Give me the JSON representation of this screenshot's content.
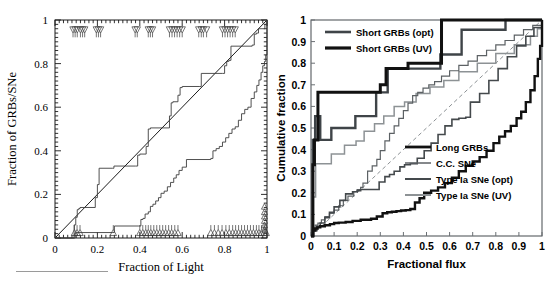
{
  "figure": {
    "title": "",
    "panels": [
      "left",
      "right"
    ]
  },
  "chart_data": [
    {
      "id": "left-panel",
      "type": "line",
      "title": "",
      "xlabel": "Fraction of Light",
      "ylabel": "Fraction of GRBs/SNe",
      "xlim": [
        0,
        1
      ],
      "ylim": [
        0,
        1
      ],
      "xticks": [
        0,
        0.2,
        0.4,
        0.6,
        0.8,
        1
      ],
      "yticks": [
        0,
        0.2,
        0.4,
        0.6,
        0.8,
        1
      ],
      "xticklabels": [
        "0",
        "0.2",
        "0.4",
        "0.6",
        "0.8",
        "1"
      ],
      "yticklabels": [
        "0",
        "0.2",
        "0.4",
        "0.6",
        "0.8",
        "1"
      ],
      "grid": false,
      "legend": "none",
      "series": [
        {
          "name": "diagonal-reference",
          "style": "solid-thin",
          "color": "#1a1a1a",
          "x": [
            0,
            1
          ],
          "y": [
            0,
            1
          ]
        },
        {
          "name": "upper-step-curve",
          "style": "step-thin",
          "color": "#3d3d3d",
          "x": [
            0.0,
            0.085,
            0.09,
            0.098,
            0.105,
            0.112,
            0.118,
            0.19,
            0.2,
            0.208,
            0.27,
            0.278,
            0.38,
            0.39,
            0.4,
            0.43,
            0.44,
            0.45,
            0.54,
            0.548,
            0.556,
            0.58,
            0.59,
            0.6,
            0.68,
            0.69,
            0.79,
            0.8,
            0.81,
            0.82,
            0.83,
            0.93,
            0.94,
            0.95,
            0.96,
            0.99,
            1.0
          ],
          "y": [
            0.0,
            0.0,
            0.06,
            0.095,
            0.13,
            0.135,
            0.14,
            0.185,
            0.245,
            0.32,
            0.32,
            0.33,
            0.33,
            0.38,
            0.385,
            0.42,
            0.5,
            0.505,
            0.56,
            0.62,
            0.625,
            0.655,
            0.69,
            0.695,
            0.695,
            0.755,
            0.755,
            0.79,
            0.81,
            0.815,
            0.88,
            0.885,
            0.935,
            0.94,
            0.96,
            0.98,
            1.0
          ]
        },
        {
          "name": "lower-step-curve",
          "style": "step-thin",
          "color": "#3d3d3d",
          "x": [
            0.0,
            0.088,
            0.095,
            0.1,
            0.27,
            0.28,
            0.395,
            0.405,
            0.415,
            0.425,
            0.44,
            0.45,
            0.462,
            0.475,
            0.488,
            0.5,
            0.515,
            0.53,
            0.545,
            0.56,
            0.572,
            0.585,
            0.6,
            0.62,
            0.735,
            0.745,
            0.76,
            0.775,
            0.79,
            0.805,
            0.82,
            0.835,
            0.85,
            0.865,
            0.88,
            0.895,
            0.91,
            0.925,
            0.94,
            0.952,
            0.962,
            0.972,
            0.98,
            0.988,
            0.994,
            1.0
          ],
          "y": [
            0.0,
            0.0,
            0.022,
            0.025,
            0.025,
            0.055,
            0.055,
            0.085,
            0.09,
            0.11,
            0.12,
            0.145,
            0.155,
            0.17,
            0.185,
            0.205,
            0.215,
            0.235,
            0.255,
            0.275,
            0.29,
            0.31,
            0.325,
            0.36,
            0.365,
            0.4,
            0.41,
            0.42,
            0.44,
            0.46,
            0.48,
            0.5,
            0.51,
            0.54,
            0.57,
            0.59,
            0.6,
            0.64,
            0.67,
            0.7,
            0.725,
            0.76,
            0.79,
            0.81,
            0.84,
            1.0
          ]
        }
      ],
      "markers": {
        "top_down_triangles_x": [
          0.085,
          0.095,
          0.105,
          0.12,
          0.13,
          0.14,
          0.195,
          0.205,
          0.215,
          0.378,
          0.388,
          0.44,
          0.45,
          0.46,
          0.54,
          0.552,
          0.564,
          0.576,
          0.588,
          0.6,
          0.678,
          0.69,
          0.7,
          0.715,
          0.79,
          0.802,
          0.814,
          0.826,
          0.838,
          0.85
        ],
        "top_down_triangles_y": 0.955,
        "bottom_up_triangles_x": [
          0.092,
          0.104,
          0.118,
          0.275,
          0.4,
          0.414,
          0.428,
          0.44,
          0.452,
          0.466,
          0.48,
          0.494,
          0.508,
          0.522,
          0.536,
          0.55,
          0.565,
          0.58,
          0.735,
          0.752,
          0.77,
          0.788,
          0.806,
          0.822,
          0.838,
          0.852,
          0.866,
          0.88,
          0.894,
          0.908,
          0.922,
          0.936,
          0.95,
          0.962,
          0.974,
          0.986,
          0.996
        ],
        "bottom_up_triangles_y": 0.025,
        "right_edge_triangles_x": 0.988,
        "right_edge_triangles_y": [
          0.04,
          0.06,
          0.08,
          0.1,
          0.12,
          0.145
        ]
      }
    },
    {
      "id": "right-panel",
      "type": "line",
      "title": "",
      "xlabel": "Fractional flux",
      "ylabel": "Cumulative fraction",
      "xlim": [
        0,
        1
      ],
      "ylim": [
        0,
        1
      ],
      "xticks": [
        0,
        0.1,
        0.2,
        0.3,
        0.4,
        0.5,
        0.6,
        0.7,
        0.8,
        0.9,
        1
      ],
      "yticks": [
        0,
        0.1,
        0.2,
        0.3,
        0.4,
        0.5,
        0.6,
        0.7,
        0.8,
        0.9,
        1
      ],
      "xticklabels": [
        "0",
        "0.1",
        "0.2",
        "0.3",
        "0.4",
        "0.5",
        "0.6",
        "0.7",
        "0.8",
        "0.9",
        "1"
      ],
      "yticklabels": [
        "0",
        "0.1",
        "0.2",
        "0.3",
        "0.4",
        "0.5",
        "0.6",
        "0.7",
        "0.8",
        "0.9",
        "1"
      ],
      "grid": false,
      "legend": "two-blocks: upper-left and lower-right",
      "legend_upper": [
        {
          "label": "Short GRBs (opt)",
          "color": "#3f4448",
          "width": 2.6
        },
        {
          "label": "Short GRBs (UV)",
          "color": "#111111",
          "width": 3.2
        }
      ],
      "legend_lower": [
        {
          "label": "Long GRBs",
          "color": "#111111",
          "width": 2.8
        },
        {
          "label": "C.C. SNe",
          "color": "#5c6164",
          "width": 1.5
        },
        {
          "label": "Type Ia SNe (opt)",
          "color": "#44494c",
          "width": 2.0
        },
        {
          "label": "Type Ia SNe (UV)",
          "color": "#8d9295",
          "width": 2.0
        }
      ],
      "series": [
        {
          "name": "diagonal-reference-dashed",
          "style": "dashed-thin",
          "color": "#8d9295",
          "x": [
            0,
            1
          ],
          "y": [
            0,
            1
          ]
        },
        {
          "name": "Short GRBs (UV)",
          "style": "step-thick",
          "color": "#111111",
          "x": [
            0.0,
            0.008,
            0.015,
            0.022,
            0.03,
            0.285,
            0.3,
            0.315,
            0.325,
            0.41,
            0.42,
            0.555,
            0.565,
            0.83,
            0.84,
            1.0
          ],
          "y": [
            0.0,
            0.33,
            0.445,
            0.445,
            0.665,
            0.665,
            0.7,
            0.7,
            0.775,
            0.775,
            0.8,
            0.8,
            1.0,
            1.0,
            1.0,
            1.0
          ]
        },
        {
          "name": "Short GRBs (opt)",
          "style": "step-thick",
          "color": "#3f4448",
          "x": [
            0.0,
            0.008,
            0.018,
            0.03,
            0.04,
            0.075,
            0.088,
            0.18,
            0.192,
            0.27,
            0.282,
            0.32,
            0.332,
            0.4,
            0.412,
            0.548,
            0.56,
            0.572,
            0.64,
            0.652,
            0.83,
            0.842,
            1.0
          ],
          "y": [
            0.0,
            0.445,
            0.555,
            0.555,
            0.445,
            0.445,
            0.5,
            0.5,
            0.555,
            0.555,
            0.665,
            0.665,
            0.775,
            0.775,
            0.775,
            0.775,
            0.84,
            0.84,
            0.84,
            0.955,
            0.955,
            1.0,
            1.0
          ]
        },
        {
          "name": "Type Ia SNe (UV)",
          "style": "step-thin",
          "color": "#8d9295",
          "x": [
            0.0,
            0.01,
            0.02,
            0.075,
            0.088,
            0.13,
            0.145,
            0.18,
            0.195,
            0.215,
            0.23,
            0.262,
            0.275,
            0.3,
            0.315,
            0.345,
            0.36,
            0.39,
            0.405,
            0.44,
            0.455,
            0.5,
            0.515,
            0.56,
            0.575,
            0.62,
            0.64,
            0.7,
            0.72,
            0.78,
            0.8,
            0.86,
            0.88,
            0.93,
            0.95,
            0.98,
            1.0
          ],
          "y": [
            0.0,
            0.18,
            0.335,
            0.335,
            0.38,
            0.38,
            0.42,
            0.42,
            0.44,
            0.44,
            0.485,
            0.485,
            0.52,
            0.52,
            0.555,
            0.555,
            0.6,
            0.6,
            0.62,
            0.62,
            0.66,
            0.66,
            0.69,
            0.69,
            0.72,
            0.72,
            0.76,
            0.76,
            0.8,
            0.8,
            0.845,
            0.845,
            0.885,
            0.885,
            0.925,
            0.96,
            1.0
          ]
        },
        {
          "name": "C.C. SNe",
          "style": "step-thin",
          "color": "#5c6164",
          "x": [
            0.0,
            0.008,
            0.018,
            0.03,
            0.045,
            0.06,
            0.08,
            0.1,
            0.12,
            0.14,
            0.16,
            0.185,
            0.2,
            0.215,
            0.225,
            0.245,
            0.265,
            0.285,
            0.3,
            0.32,
            0.34,
            0.36,
            0.38,
            0.4,
            0.42,
            0.44,
            0.462,
            0.485,
            0.51,
            0.535,
            0.565,
            0.6,
            0.64,
            0.68,
            0.72,
            0.76,
            0.8,
            0.84,
            0.88,
            0.92,
            0.96,
            1.0
          ],
          "y": [
            0.0,
            0.03,
            0.05,
            0.06,
            0.075,
            0.09,
            0.105,
            0.12,
            0.14,
            0.165,
            0.185,
            0.205,
            0.215,
            0.225,
            0.245,
            0.3,
            0.325,
            0.355,
            0.395,
            0.44,
            0.475,
            0.51,
            0.545,
            0.58,
            0.615,
            0.65,
            0.665,
            0.685,
            0.7,
            0.715,
            0.74,
            0.765,
            0.79,
            0.81,
            0.835,
            0.86,
            0.885,
            0.905,
            0.93,
            0.955,
            0.975,
            1.0
          ]
        },
        {
          "name": "Type Ia SNe (opt)",
          "style": "step-thin",
          "color": "#44494c",
          "x": [
            0.0,
            0.012,
            0.025,
            0.04,
            0.06,
            0.08,
            0.1,
            0.125,
            0.15,
            0.18,
            0.2,
            0.215,
            0.28,
            0.295,
            0.32,
            0.34,
            0.36,
            0.385,
            0.405,
            0.43,
            0.46,
            0.49,
            0.52,
            0.55,
            0.58,
            0.61,
            0.64,
            0.67,
            0.69,
            0.73,
            0.77,
            0.81,
            0.85,
            0.89,
            0.93,
            0.965,
            1.0
          ],
          "y": [
            0.0,
            0.025,
            0.045,
            0.06,
            0.085,
            0.11,
            0.135,
            0.165,
            0.195,
            0.205,
            0.21,
            0.215,
            0.215,
            0.25,
            0.275,
            0.285,
            0.3,
            0.32,
            0.33,
            0.335,
            0.36,
            0.395,
            0.43,
            0.47,
            0.51,
            0.54,
            0.545,
            0.55,
            0.62,
            0.66,
            0.72,
            0.775,
            0.83,
            0.88,
            0.925,
            0.965,
            1.0
          ]
        },
        {
          "name": "Long GRBs",
          "style": "step-thick",
          "color": "#111111",
          "x": [
            0.0,
            0.008,
            0.018,
            0.028,
            0.04,
            0.06,
            0.082,
            0.1,
            0.12,
            0.15,
            0.18,
            0.215,
            0.26,
            0.285,
            0.31,
            0.33,
            0.35,
            0.37,
            0.39,
            0.41,
            0.43,
            0.45,
            0.47,
            0.49,
            0.52,
            0.55,
            0.58,
            0.61,
            0.64,
            0.67,
            0.7,
            0.73,
            0.76,
            0.79,
            0.815,
            0.84,
            0.865,
            0.89,
            0.91,
            0.93,
            0.95,
            0.968,
            0.982,
            0.992,
            1.0
          ],
          "y": [
            0.0,
            0.025,
            0.035,
            0.04,
            0.045,
            0.05,
            0.055,
            0.06,
            0.062,
            0.065,
            0.07,
            0.075,
            0.08,
            0.09,
            0.105,
            0.11,
            0.112,
            0.115,
            0.118,
            0.12,
            0.125,
            0.155,
            0.175,
            0.2,
            0.21,
            0.225,
            0.245,
            0.27,
            0.3,
            0.325,
            0.345,
            0.365,
            0.395,
            0.43,
            0.46,
            0.485,
            0.51,
            0.545,
            0.575,
            0.62,
            0.675,
            0.74,
            0.82,
            0.88,
            1.0
          ]
        }
      ]
    }
  ]
}
